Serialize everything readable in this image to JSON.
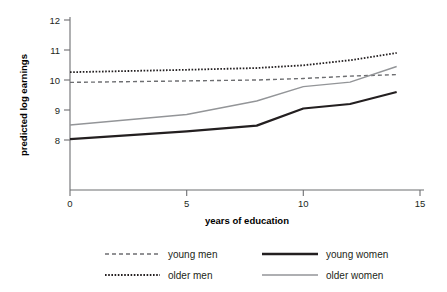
{
  "chart_data": {
    "type": "line",
    "title": "",
    "xlabel": "years of education",
    "ylabel": "predicted log earnings",
    "xlim": [
      0,
      15
    ],
    "ylim": [
      7.2,
      12
    ],
    "xticks": [
      0,
      5,
      10,
      15
    ],
    "xtick_labels": [
      "0",
      "5",
      "10",
      "15"
    ],
    "yticks": [
      8,
      9,
      10,
      11,
      12
    ],
    "ytick_labels": [
      "8",
      "9",
      "10",
      "11",
      "12"
    ],
    "grid": false,
    "legend_position": "below",
    "x": [
      0,
      5,
      8,
      10,
      12,
      14
    ],
    "series": [
      {
        "name": "young men",
        "style": "dashed",
        "color": "#6d6e71",
        "width": 1.4,
        "values": [
          9.92,
          9.97,
          10.0,
          10.05,
          10.13,
          10.18
        ]
      },
      {
        "name": "older men",
        "style": "dotted",
        "color": "#231f20",
        "width": 1.8,
        "values": [
          10.26,
          10.34,
          10.4,
          10.49,
          10.66,
          10.9
        ]
      },
      {
        "name": "young women",
        "style": "solid",
        "color": "#231f20",
        "width": 2.2,
        "values": [
          8.03,
          8.29,
          8.48,
          9.05,
          9.2,
          9.6
        ]
      },
      {
        "name": "older women",
        "style": "solid",
        "color": "#939598",
        "width": 1.4,
        "values": [
          8.5,
          8.85,
          9.3,
          9.78,
          9.93,
          10.45
        ]
      }
    ]
  },
  "legend": {
    "entries": [
      {
        "label": "young men",
        "swatch": "dashed-gray"
      },
      {
        "label": "older men",
        "swatch": "dotted-black"
      },
      {
        "label": "young women",
        "swatch": "solid-black"
      },
      {
        "label": "older women",
        "swatch": "solid-gray"
      }
    ]
  },
  "axes": {
    "x_title": "years of education",
    "y_title": "predicted log earnings"
  }
}
